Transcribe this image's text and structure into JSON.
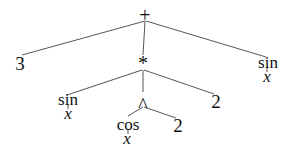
{
  "diagram": {
    "type": "expression-tree",
    "expression": "3 + (sin x * (cos x ^ 2) * 2) + sin x",
    "nodes": {
      "root": {
        "label": "+"
      },
      "three": {
        "label": "3"
      },
      "mult": {
        "label": "*"
      },
      "sin_right": {
        "label": "sin"
      },
      "sin_right_arg": {
        "label": "x"
      },
      "sin_left": {
        "label": "sin"
      },
      "sin_left_arg": {
        "label": "x"
      },
      "pow": {
        "label": "^"
      },
      "two_mult": {
        "label": "2"
      },
      "cos": {
        "label": "cos"
      },
      "cos_arg": {
        "label": "x"
      },
      "two_pow": {
        "label": "2"
      }
    },
    "edges": [
      [
        "root",
        "three"
      ],
      [
        "root",
        "mult"
      ],
      [
        "root",
        "sin_right"
      ],
      [
        "mult",
        "sin_left"
      ],
      [
        "mult",
        "pow"
      ],
      [
        "mult",
        "two_mult"
      ],
      [
        "pow",
        "cos"
      ],
      [
        "pow",
        "two_pow"
      ]
    ]
  }
}
